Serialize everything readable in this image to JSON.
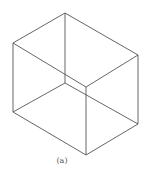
{
  "figure": {
    "caption": "(a)",
    "stroke_color": "#555555",
    "vertices": {
      "top_back": [
        65,
        13
      ],
      "top_left": [
        13,
        43
      ],
      "top_front": [
        86,
        87
      ],
      "top_right": [
        138,
        55
      ],
      "bottom_back": [
        65,
        83
      ],
      "bottom_left": [
        13,
        112
      ],
      "bottom_front": [
        86,
        155
      ],
      "bottom_right": [
        138,
        124
      ]
    },
    "edges": [
      [
        "top_back",
        "top_left"
      ],
      [
        "top_left",
        "top_front"
      ],
      [
        "top_front",
        "top_right"
      ],
      [
        "top_right",
        "top_back"
      ],
      [
        "top_left",
        "bottom_left"
      ],
      [
        "top_front",
        "bottom_front"
      ],
      [
        "top_right",
        "bottom_right"
      ],
      [
        "top_back",
        "bottom_back"
      ],
      [
        "bottom_left",
        "bottom_front"
      ],
      [
        "bottom_front",
        "bottom_right"
      ],
      [
        "bottom_left",
        "bottom_back"
      ],
      [
        "bottom_back",
        "bottom_right"
      ]
    ]
  }
}
